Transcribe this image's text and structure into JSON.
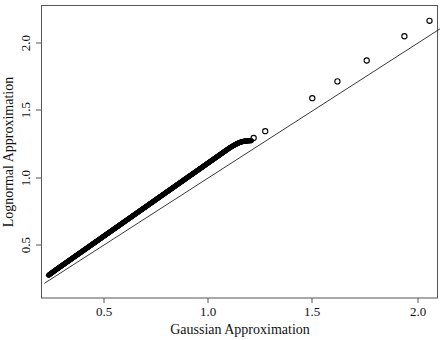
{
  "chart_data": {
    "type": "scatter",
    "title": "",
    "subtitle": "",
    "xlabel": "Gaussian Approximation",
    "ylabel": "Lognormal Approximation",
    "xlim": [
      0.21,
      2.11
    ],
    "ylim": [
      0.235,
      2.17
    ],
    "xticks": [
      0.5,
      1.0,
      1.5,
      2.0
    ],
    "xtick_labels": [
      "0.5",
      "1.0",
      "1.5",
      "2.0"
    ],
    "yticks": [
      0.5,
      1.0,
      1.5,
      2.0
    ],
    "ytick_labels": [
      "0.5",
      "1.0",
      "1.5",
      "2.0"
    ],
    "grid": false,
    "legend": null,
    "legend_position": "none",
    "marker": "open-circle",
    "marker_color": "#000000",
    "reference_line": {
      "name": "identity-line",
      "type": "line",
      "slope": 1.0,
      "intercept": 0.0,
      "x": [
        0.215,
        2.105
      ],
      "y": [
        0.215,
        2.105
      ],
      "color": "#222222",
      "width": 0.9
    },
    "dense_cluster": {
      "description": "dense overlapping markers forming a solid band slightly above the identity line",
      "x_start": 0.235,
      "x_end": 1.205,
      "y_start": 0.275,
      "y_end": 1.275,
      "n_points_approx": 500
    },
    "outliers": {
      "x": [
        1.215,
        1.27,
        1.495,
        1.615,
        1.755,
        1.935,
        2.055
      ],
      "y": [
        1.295,
        1.345,
        1.59,
        1.715,
        1.87,
        2.05,
        2.165
      ]
    },
    "series": [
      {
        "name": "quantile-pairs",
        "marker": "open-circle",
        "color": "#000000",
        "points": [
          [
            0.235,
            0.275
          ],
          [
            0.245,
            0.287
          ],
          [
            0.256,
            0.299
          ],
          [
            0.266,
            0.311
          ],
          [
            0.277,
            0.323
          ],
          [
            0.288,
            0.335
          ],
          [
            0.299,
            0.347
          ],
          [
            0.31,
            0.359
          ],
          [
            0.321,
            0.371
          ],
          [
            0.332,
            0.383
          ],
          [
            0.343,
            0.395
          ],
          [
            0.354,
            0.407
          ],
          [
            0.365,
            0.419
          ],
          [
            0.376,
            0.431
          ],
          [
            0.387,
            0.443
          ],
          [
            0.398,
            0.455
          ],
          [
            0.409,
            0.467
          ],
          [
            0.42,
            0.479
          ],
          [
            0.431,
            0.491
          ],
          [
            0.442,
            0.503
          ],
          [
            0.453,
            0.515
          ],
          [
            0.464,
            0.527
          ],
          [
            0.475,
            0.539
          ],
          [
            0.486,
            0.551
          ],
          [
            0.497,
            0.563
          ],
          [
            0.508,
            0.575
          ],
          [
            0.519,
            0.587
          ],
          [
            0.53,
            0.599
          ],
          [
            0.541,
            0.611
          ],
          [
            0.552,
            0.623
          ],
          [
            0.563,
            0.635
          ],
          [
            0.574,
            0.647
          ],
          [
            0.585,
            0.659
          ],
          [
            0.596,
            0.671
          ],
          [
            0.607,
            0.683
          ],
          [
            0.618,
            0.695
          ],
          [
            0.629,
            0.707
          ],
          [
            0.64,
            0.719
          ],
          [
            0.651,
            0.731
          ],
          [
            0.662,
            0.743
          ],
          [
            0.673,
            0.755
          ],
          [
            0.684,
            0.767
          ],
          [
            0.695,
            0.779
          ],
          [
            0.706,
            0.791
          ],
          [
            0.717,
            0.803
          ],
          [
            0.728,
            0.815
          ],
          [
            0.739,
            0.827
          ],
          [
            0.75,
            0.839
          ],
          [
            0.761,
            0.851
          ],
          [
            0.772,
            0.863
          ],
          [
            0.783,
            0.875
          ],
          [
            0.794,
            0.887
          ],
          [
            0.805,
            0.899
          ],
          [
            0.816,
            0.911
          ],
          [
            0.827,
            0.923
          ],
          [
            0.838,
            0.935
          ],
          [
            0.849,
            0.947
          ],
          [
            0.86,
            0.959
          ],
          [
            0.871,
            0.971
          ],
          [
            0.882,
            0.983
          ],
          [
            0.893,
            0.995
          ],
          [
            0.904,
            1.007
          ],
          [
            0.915,
            1.019
          ],
          [
            0.926,
            1.031
          ],
          [
            0.937,
            1.043
          ],
          [
            0.948,
            1.055
          ],
          [
            0.959,
            1.067
          ],
          [
            0.97,
            1.079
          ],
          [
            0.981,
            1.091
          ],
          [
            0.992,
            1.103
          ],
          [
            1.003,
            1.115
          ],
          [
            1.014,
            1.127
          ],
          [
            1.025,
            1.139
          ],
          [
            1.036,
            1.151
          ],
          [
            1.047,
            1.163
          ],
          [
            1.058,
            1.175
          ],
          [
            1.069,
            1.187
          ],
          [
            1.08,
            1.199
          ],
          [
            1.091,
            1.211
          ],
          [
            1.102,
            1.223
          ],
          [
            1.113,
            1.233
          ],
          [
            1.124,
            1.243
          ],
          [
            1.135,
            1.252
          ],
          [
            1.146,
            1.26
          ],
          [
            1.157,
            1.266
          ],
          [
            1.168,
            1.27
          ],
          [
            1.179,
            1.272
          ],
          [
            1.192,
            1.274
          ],
          [
            1.205,
            1.275
          ],
          [
            1.215,
            1.295
          ],
          [
            1.27,
            1.345
          ],
          [
            1.495,
            1.59
          ],
          [
            1.615,
            1.715
          ],
          [
            1.755,
            1.87
          ],
          [
            1.935,
            2.05
          ],
          [
            2.055,
            2.165
          ]
        ]
      }
    ]
  },
  "axes": {
    "x_axis_name": "gaussian-approximation-axis",
    "y_axis_name": "lognormal-approximation-axis"
  }
}
